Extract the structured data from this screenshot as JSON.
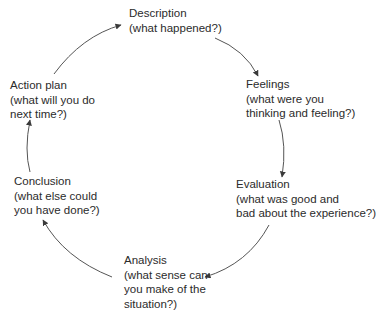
{
  "diagram": {
    "type": "cycle",
    "direction": "clockwise",
    "stages": [
      {
        "id": "description",
        "title": "Description",
        "lines": [
          "Description",
          "(what happened?)"
        ]
      },
      {
        "id": "feelings",
        "title": "Feelings",
        "lines": [
          "Feelings",
          "(what were you",
          "thinking and feeling?)"
        ]
      },
      {
        "id": "evaluation",
        "title": "Evaluation",
        "lines": [
          "Evaluation",
          "(what was good and",
          "bad about the experience?)"
        ]
      },
      {
        "id": "analysis",
        "title": "Analysis",
        "lines": [
          "Analysis",
          "(what sense can",
          "you make of the",
          "situation?)"
        ]
      },
      {
        "id": "conclusion",
        "title": "Conclusion",
        "lines": [
          "Conclusion",
          "(what else could",
          "you have done?)"
        ]
      },
      {
        "id": "action-plan",
        "title": "Action plan",
        "lines": [
          "Action plan",
          "(what will you do",
          "next time?)"
        ]
      }
    ],
    "edges": [
      {
        "from": "description",
        "to": "feelings"
      },
      {
        "from": "feelings",
        "to": "evaluation"
      },
      {
        "from": "evaluation",
        "to": "analysis"
      },
      {
        "from": "analysis",
        "to": "conclusion"
      },
      {
        "from": "conclusion",
        "to": "action-plan"
      },
      {
        "from": "action-plan",
        "to": "description"
      }
    ],
    "colors": {
      "text": "#2b2b2b",
      "arrow": "#555555",
      "background": "#ffffff"
    }
  }
}
